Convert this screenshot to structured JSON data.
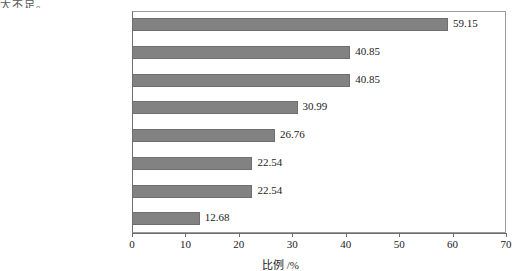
{
  "page": {
    "clipped_text": "大不足。"
  },
  "chart_data": {
    "type": "bar",
    "orientation": "horizontal",
    "title": "",
    "xlabel": "比例 /%",
    "ylabel": "",
    "xlim": [
      0,
      70
    ],
    "xticks": [
      0,
      10,
      20,
      30,
      40,
      50,
      60,
      70
    ],
    "grid": false,
    "legend": false,
    "bar_color": "#828282",
    "bar_edge_color": "#6f6f6f",
    "categories": [
      "对 “智慧工地” 价值认识不足",
      "缺乏标准规范体系",
      "投入不足",
      "行业主管部门的引导不足",
      "相关人才的缺失",
      "配套软硬件不成熟",
      "购买与维护成本高",
      "工人不配合 / 难上手"
    ],
    "values": [
      59.15,
      40.85,
      40.85,
      30.99,
      26.76,
      22.54,
      22.54,
      12.68
    ],
    "value_labels": [
      "59.15",
      "40.85",
      "40.85",
      "30.99",
      "26.76",
      "22.54",
      "22.54",
      "12.68"
    ]
  }
}
